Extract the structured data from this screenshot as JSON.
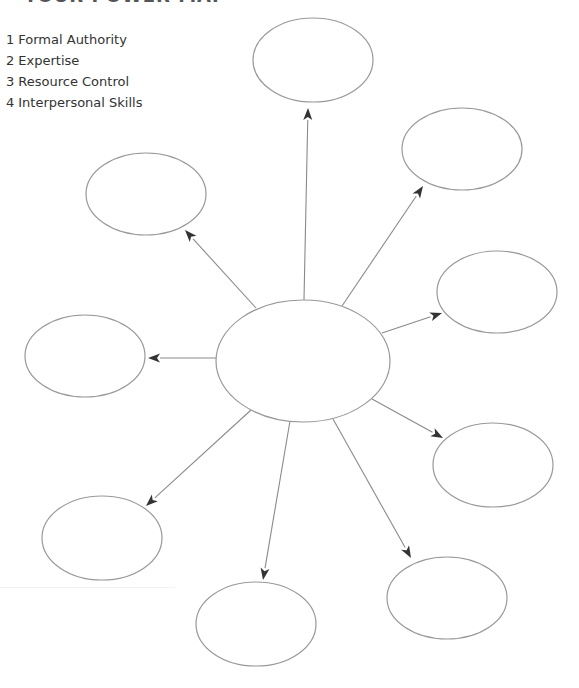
{
  "title": "YOUR POWER MAP",
  "legend": [
    {
      "num": "1",
      "label": "Formal Authority"
    },
    {
      "num": "2",
      "label": "Expertise"
    },
    {
      "num": "3",
      "label": "Resource Control"
    },
    {
      "num": "4",
      "label": "Interpersonal Skills"
    }
  ],
  "diagram": {
    "center": {
      "label": "",
      "cx": 303,
      "cy": 361,
      "rx": 87,
      "ry": 61
    },
    "satellites": [
      {
        "id": "top",
        "label": "",
        "cx": 313,
        "cy": 60,
        "rx": 60,
        "ry": 42,
        "from": [
          304,
          300
        ],
        "to": [
          308,
          108
        ]
      },
      {
        "id": "top-right",
        "label": "",
        "cx": 462,
        "cy": 149,
        "rx": 60,
        "ry": 41,
        "from": [
          342,
          306
        ],
        "to": [
          423,
          186
        ]
      },
      {
        "id": "right",
        "label": "",
        "cx": 497,
        "cy": 292,
        "rx": 60,
        "ry": 41,
        "from": [
          382,
          333
        ],
        "to": [
          442,
          313
        ]
      },
      {
        "id": "lower-right",
        "label": "",
        "cx": 493,
        "cy": 465,
        "rx": 60,
        "ry": 42,
        "from": [
          372,
          399
        ],
        "to": [
          443,
          438
        ]
      },
      {
        "id": "bottom-right",
        "label": "",
        "cx": 447,
        "cy": 598,
        "rx": 60,
        "ry": 41,
        "from": [
          333,
          419
        ],
        "to": [
          411,
          558
        ]
      },
      {
        "id": "bottom",
        "label": "",
        "cx": 256,
        "cy": 624,
        "rx": 60,
        "ry": 42,
        "from": [
          290,
          421
        ],
        "to": [
          263,
          580
        ]
      },
      {
        "id": "bottom-left",
        "label": "",
        "cx": 102,
        "cy": 538,
        "rx": 60,
        "ry": 42,
        "from": [
          251,
          410
        ],
        "to": [
          146,
          506
        ]
      },
      {
        "id": "left",
        "label": "",
        "cx": 85,
        "cy": 356,
        "rx": 60,
        "ry": 41,
        "from": [
          216,
          358
        ],
        "to": [
          148,
          358
        ]
      },
      {
        "id": "upper-left",
        "label": "",
        "cx": 146,
        "cy": 194,
        "rx": 60,
        "ry": 41,
        "from": [
          256,
          308
        ],
        "to": [
          185,
          230
        ]
      }
    ],
    "colors": {
      "node_stroke": "#999999",
      "connector": "#8a8a8a",
      "arrowhead": "#333333",
      "background": "#ffffff"
    }
  }
}
